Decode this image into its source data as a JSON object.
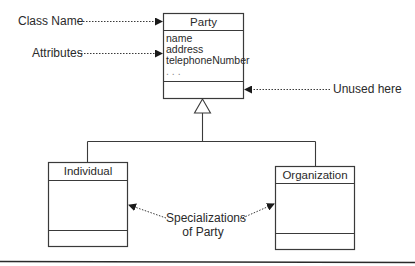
{
  "diagram": {
    "type": "UML class diagram",
    "annotations": {
      "class_name": "Class Name",
      "attributes": "Attributes",
      "unused_here": "Unused here",
      "specializations_line1": "Specializations",
      "specializations_line2": "of Party"
    },
    "classes": {
      "party": {
        "name": "Party",
        "attributes": [
          "name",
          "address",
          "telephoneNumber",
          ". . ."
        ],
        "operations": []
      },
      "individual": {
        "name": "Individual",
        "attributes": [],
        "operations": []
      },
      "organization": {
        "name": "Organization",
        "attributes": [],
        "operations": []
      }
    },
    "relationships": [
      {
        "type": "generalization",
        "from": "Individual",
        "to": "Party"
      },
      {
        "type": "generalization",
        "from": "Organization",
        "to": "Party"
      }
    ],
    "colors": {
      "line": "#3a3a3a",
      "text": "#2a2a2a",
      "background": "#ffffff"
    }
  }
}
